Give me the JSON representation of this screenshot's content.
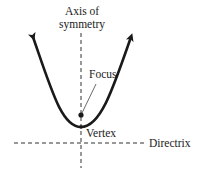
{
  "diagram": {
    "labels": {
      "axis_line1": "Axis of",
      "axis_line2": "symmetry",
      "focus": "Focus",
      "vertex": "Vertex",
      "directrix": "Directrix"
    },
    "colors": {
      "curve": "#1a1a1a",
      "dashed": "#333333",
      "background": "#ffffff"
    }
  }
}
